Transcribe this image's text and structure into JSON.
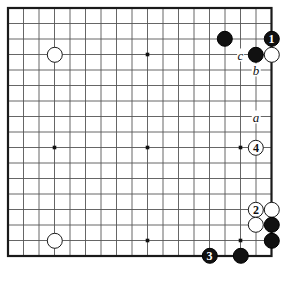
{
  "diagram": {
    "kind": "go-board-diagram",
    "board": {
      "cols": 18,
      "rows": 17,
      "origin_x": 8,
      "origin_y": 8,
      "spacing": 15.5,
      "stone_radius": 8.2,
      "line_color": "#555555",
      "border_color": "#1a1a1a",
      "background": "#ffffff",
      "black_color": "#111111",
      "white_color": "#ffffff",
      "star_points": [
        {
          "col": 3,
          "row": 9
        },
        {
          "col": 9,
          "row": 3
        },
        {
          "col": 9,
          "row": 9
        },
        {
          "col": 9,
          "row": 15
        },
        {
          "col": 15,
          "row": 3
        },
        {
          "col": 15,
          "row": 9
        },
        {
          "col": 15,
          "row": 15
        },
        {
          "col": 3,
          "row": 3
        },
        {
          "col": 3,
          "row": 15
        }
      ]
    },
    "stones": [
      {
        "id": "w-upper-left",
        "color": "white",
        "col": 3,
        "row": 3,
        "label": ""
      },
      {
        "id": "b-top-left-of-group",
        "color": "black",
        "col": 14,
        "row": 2,
        "label": ""
      },
      {
        "id": "b-move-1",
        "color": "black",
        "col": 17,
        "row": 2,
        "label": "1"
      },
      {
        "id": "b-corner-side",
        "color": "black",
        "col": 16,
        "row": 3,
        "label": ""
      },
      {
        "id": "w-beside-one",
        "color": "white",
        "col": 17,
        "row": 3,
        "label": ""
      },
      {
        "id": "w-move-4",
        "color": "white",
        "col": 16,
        "row": 9,
        "label": "4"
      },
      {
        "id": "w-move-2",
        "color": "white",
        "col": 16,
        "row": 13,
        "label": "2"
      },
      {
        "id": "w-right-of-2",
        "color": "white",
        "col": 17,
        "row": 13,
        "label": ""
      },
      {
        "id": "w-below-2",
        "color": "white",
        "col": 16,
        "row": 14,
        "label": ""
      },
      {
        "id": "b-right-upper",
        "color": "black",
        "col": 17,
        "row": 14,
        "label": ""
      },
      {
        "id": "b-right-lower",
        "color": "black",
        "col": 17,
        "row": 15,
        "label": ""
      },
      {
        "id": "b-move-3",
        "color": "black",
        "col": 13,
        "row": 16,
        "label": "3"
      },
      {
        "id": "b-bottom-right",
        "color": "black",
        "col": 15,
        "row": 16,
        "label": ""
      },
      {
        "id": "w-lower-left",
        "color": "white",
        "col": 3,
        "row": 15,
        "label": ""
      }
    ],
    "point_labels": [
      {
        "id": "label-a",
        "text": "a",
        "col": 16,
        "row": 7
      },
      {
        "id": "label-b",
        "text": "b",
        "col": 16,
        "row": 4
      },
      {
        "id": "label-c",
        "text": "c",
        "col": 15,
        "row": 3
      }
    ]
  }
}
